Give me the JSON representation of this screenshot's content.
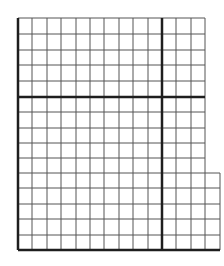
{
  "diagram": {
    "type": "grid-paper",
    "colors": {
      "background": "#ffffff",
      "thin_line": "#555555",
      "thick_line": "#1e1e1e"
    },
    "grid": {
      "left": 18,
      "top": 18,
      "vertical_lines": [
        18,
        32,
        47,
        61,
        76,
        90,
        104,
        119,
        133,
        148,
        162,
        176,
        191,
        205,
        220
      ],
      "horizontal_lines": [
        18,
        34,
        50,
        65,
        81,
        97,
        112,
        128,
        143,
        158,
        173,
        188,
        204,
        219,
        235,
        250
      ],
      "main_right": 205,
      "extension_right": 220,
      "extension_top": 173,
      "bottom": 250,
      "thick_vertical": 162,
      "thick_horizontal": 97
    }
  }
}
